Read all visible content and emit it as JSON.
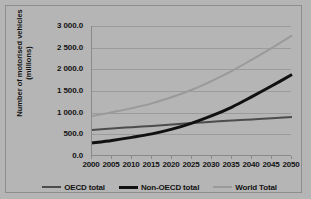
{
  "chart_data": {
    "type": "line",
    "title": "",
    "xlabel": "",
    "ylabel": "Number of motorised vehicles\n(millions)",
    "x": [
      2000,
      2005,
      2010,
      2015,
      2020,
      2025,
      2030,
      2035,
      2040,
      2045,
      2050
    ],
    "xlim": [
      2000,
      2050
    ],
    "ylim": [
      0,
      3000
    ],
    "grid": true,
    "legend_position": "bottom",
    "x_tick_labels": [
      "2000",
      "2005",
      "2010",
      "2015",
      "2020",
      "2025",
      "2030",
      "2035",
      "2040",
      "2045",
      "2050"
    ],
    "y_tick_labels": [
      "0.0",
      "500.0",
      "1 000.0",
      "1 500.0",
      "2 000.0",
      "2 500.0",
      "3 000.0"
    ],
    "y_ticks": [
      0,
      500,
      1000,
      1500,
      2000,
      2500,
      3000
    ],
    "series": [
      {
        "name": "OECD total",
        "color": "#4c4c4c",
        "width": 2,
        "values": [
          600,
          635,
          665,
          695,
          725,
          760,
          790,
          820,
          845,
          870,
          900
        ]
      },
      {
        "name": "Non-OECD total",
        "color": "#111111",
        "width": 3,
        "values": [
          300,
          360,
          430,
          510,
          620,
          760,
          930,
          1130,
          1370,
          1620,
          1880
        ]
      },
      {
        "name": "World Total",
        "color": "#9a9a9a",
        "width": 2,
        "values": [
          920,
          1010,
          1105,
          1215,
          1360,
          1530,
          1735,
          1965,
          2225,
          2495,
          2780
        ]
      }
    ]
  },
  "legend": {
    "items": [
      {
        "label": "OECD total"
      },
      {
        "label": "Non-OECD total"
      },
      {
        "label": "World Total"
      }
    ]
  },
  "axes": {
    "y_title": "Number of motorised vehicles\n(millions)"
  },
  "colors": {
    "background": "#b5b5b5",
    "gridline": "#9b9b9b",
    "axis": "#8a8a8a",
    "text": "#131313",
    "oecd": "#4c4c4c",
    "non_oecd": "#111111",
    "world": "#9a9a9a"
  }
}
